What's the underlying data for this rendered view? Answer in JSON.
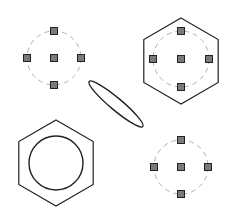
{
  "diagram": {
    "width": 230,
    "height": 223,
    "colors": {
      "background": "#ffffff",
      "stroke": "#222222",
      "dashed_circle": "#b0b0b0",
      "handle_fill": "#7a7a7a",
      "handle_stroke": "#222222"
    },
    "shapes": [
      {
        "type": "handle-group",
        "name": "selection-circle-top-left",
        "cx": 54,
        "cy": 58,
        "r": 27
      },
      {
        "type": "hexagon-with-handles",
        "name": "hexagon-top-right",
        "cx": 181,
        "cy": 61,
        "hex_r": 43,
        "circle_r": 28
      },
      {
        "type": "ellipse",
        "name": "diagonal-ellipse",
        "cx": 116,
        "cy": 104,
        "rx": 35,
        "ry": 6,
        "angle": 40
      },
      {
        "type": "hexagon-with-circle",
        "name": "hexagon-bottom-left",
        "cx": 56,
        "cy": 163,
        "hex_r": 43,
        "circle_r": 27
      },
      {
        "type": "handle-group",
        "name": "selection-circle-bottom-right",
        "cx": 181,
        "cy": 167,
        "r": 27
      }
    ]
  }
}
